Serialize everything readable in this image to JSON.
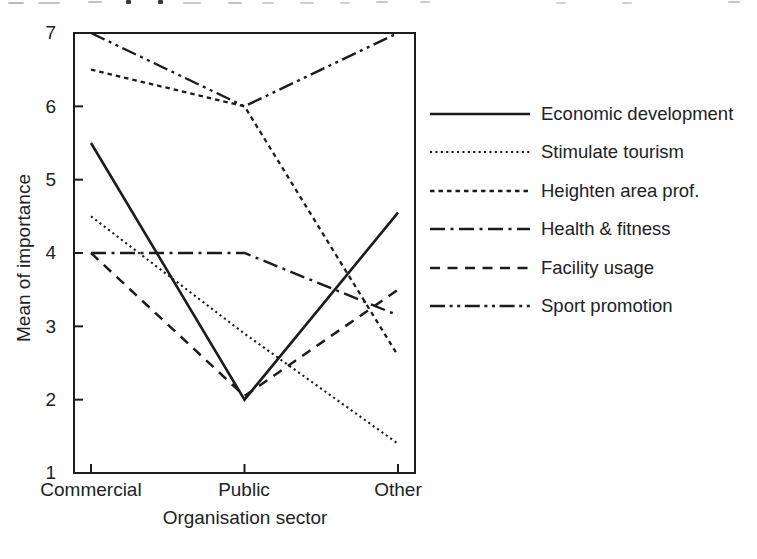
{
  "page": {
    "background": "#fefefe",
    "ink": "#1c1c1c"
  },
  "chart_data": {
    "type": "line",
    "title": "",
    "xlabel": "Organisation sector",
    "ylabel": "Mean of importance",
    "categories": [
      "Commercial",
      "Public",
      "Other"
    ],
    "series": [
      {
        "name": "Economic development",
        "style": "solid",
        "values": [
          5.5,
          2.0,
          4.55
        ]
      },
      {
        "name": "Stimulate tourism",
        "style": "dotted",
        "values": [
          4.5,
          2.9,
          1.4
        ]
      },
      {
        "name": "Heighten area prof.",
        "style": "fine-dash",
        "values": [
          6.5,
          6.0,
          2.6
        ]
      },
      {
        "name": "Health & fitness",
        "style": "dash-dot",
        "values": [
          4.0,
          4.0,
          3.15
        ]
      },
      {
        "name": "Facility usage",
        "style": "medium-dash",
        "values": [
          4.0,
          2.05,
          3.5
        ]
      },
      {
        "name": "Sport promotion",
        "style": "dash-dot-dot",
        "values": [
          7.0,
          6.0,
          7.0
        ]
      }
    ],
    "ylim": [
      1,
      7
    ],
    "yticks": [
      "7",
      "6",
      "5",
      "4",
      "3",
      "2",
      "1"
    ],
    "grid": false,
    "legend_position": "right",
    "line_color": "#1c1c1c"
  }
}
